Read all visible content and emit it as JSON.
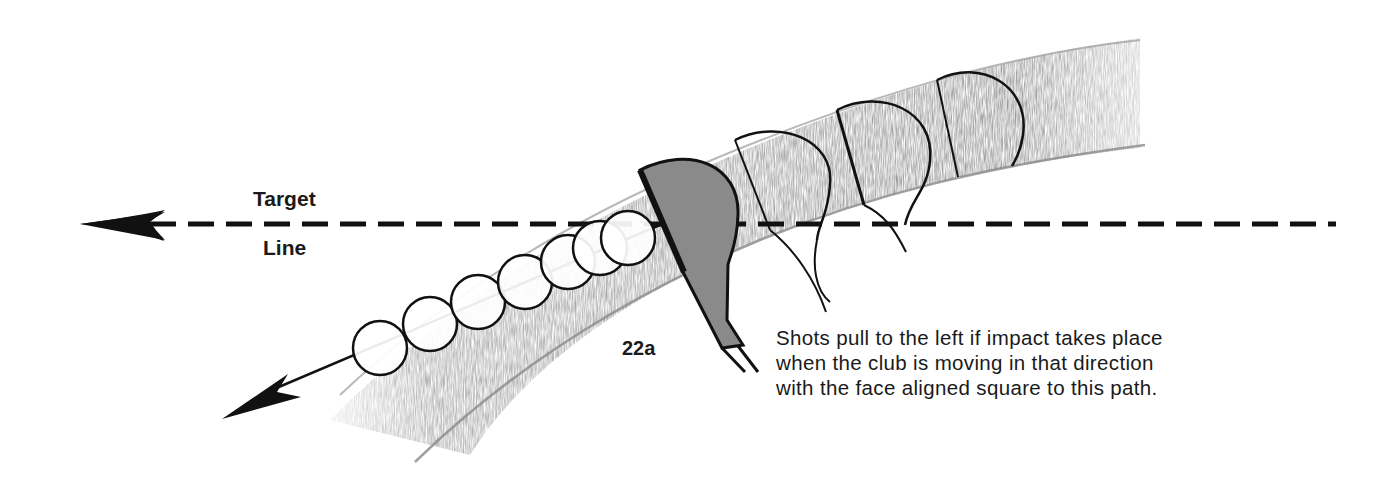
{
  "figure": {
    "id_label": "22a",
    "target_line_label": {
      "line1": "Target",
      "line2": "Line"
    },
    "caption": {
      "lines": [
        "Shots pull to the left if impact takes place",
        "when the club is moving in that direction",
        "with the face aligned square to this path."
      ]
    },
    "elements": {
      "swing_path_band": "curved-gray-swath",
      "target_line": "dashed-horizontal-line-with-arrow-left",
      "ball_path": "ball-sequence-with-arrow-down-left",
      "clubheads": "clubhead-sequence",
      "ball_count": 7,
      "clubhead_count": 4
    },
    "colors": {
      "ink": "#111111",
      "swath": "#8c8c8c",
      "clubhead_fill": "#8a8a8a",
      "background": "#ffffff"
    }
  }
}
